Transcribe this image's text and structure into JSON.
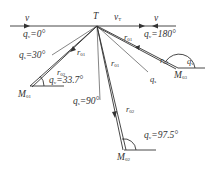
{
  "diagram": {
    "target_label": "T",
    "velocity_labels": {
      "left_v": "v",
      "target_v": "v",
      "target_v_sub": "T",
      "right_v": "v"
    },
    "case1": {
      "qv": "q",
      "qv_sub": "v",
      "qv_val": "=0°",
      "qs": "q",
      "qs_sub": "s",
      "qs_val": "=30°",
      "r1": "r",
      "r1_sub": "01",
      "r2": "r",
      "r2_sub": "02",
      "qv2": "q",
      "qv2_sub": "v",
      "qv2_val": "=33.7°",
      "m": "M",
      "m_sub": "01"
    },
    "case2": {
      "qs": "q",
      "qs_sub": "s",
      "qs_val": "=90°",
      "r1": "r",
      "r1_sub": "01",
      "r2": "r",
      "r2_sub": "02",
      "qv": "q",
      "qv_sub": "v",
      "qv_val": "=97.5°",
      "m": "M",
      "m_sub": "02"
    },
    "case3": {
      "qv": "q",
      "qv_sub": "v",
      "qv_val": "=180°",
      "r1": "r",
      "r1_sub": "01",
      "r2": "r",
      "r2_sub": "02",
      "qs": "q",
      "qs_sub": "s",
      "qv2": "q",
      "qv2_sub": "v",
      "m": "M",
      "m_sub": "03"
    },
    "colors": {
      "line": "#333333",
      "text": "#333333",
      "background": "#ffffff"
    }
  }
}
